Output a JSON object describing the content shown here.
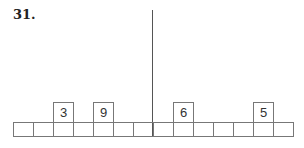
{
  "problem": {
    "number": "31."
  },
  "cells": [
    {
      "value": null
    },
    {
      "value": null
    },
    {
      "value": "3"
    },
    {
      "value": null
    },
    {
      "value": "9"
    },
    {
      "value": null
    },
    {
      "value": null
    },
    {
      "value": null
    },
    {
      "value": "6"
    },
    {
      "value": null
    },
    {
      "value": null
    },
    {
      "value": null
    },
    {
      "value": "5"
    },
    {
      "value": null
    }
  ]
}
